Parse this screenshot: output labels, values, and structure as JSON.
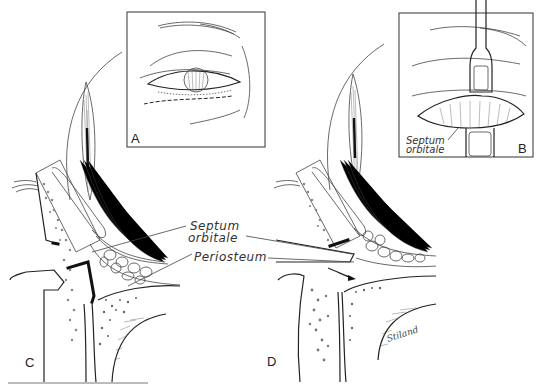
{
  "figure": {
    "panels": [
      {
        "id": "A",
        "label": "A",
        "description": "Eye with lower lid incision line (dashed)"
      },
      {
        "id": "B",
        "label": "B",
        "description": "Retracted lower lid exposing septum",
        "annotation": "Septum\norbitale",
        "annotation_line1": "Septum",
        "annotation_line2": "orbitale"
      },
      {
        "id": "C",
        "label": "C",
        "description": "Sagittal section of lower lid and orbital rim"
      },
      {
        "id": "D",
        "label": "D",
        "description": "Sagittal section after septum incision with arrow",
        "signature": "Stiland"
      }
    ],
    "callouts": {
      "septum_line1": "Septum",
      "septum_line2": "orbitale",
      "periosteum": "Periosteum"
    },
    "colors": {
      "ink": "#222222",
      "background": "#ffffff"
    }
  }
}
